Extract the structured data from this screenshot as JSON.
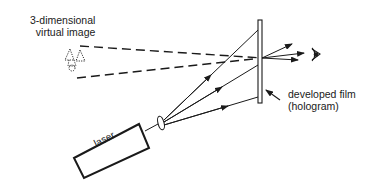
{
  "diagram": {
    "labels": {
      "virtual_image_line1": "3-dimensional",
      "virtual_image_line2": "virtual image",
      "film_line1": "developed film",
      "film_line2": "(hologram)",
      "laser": "laser"
    },
    "components": [
      {
        "id": "laser",
        "label": "laser"
      },
      {
        "id": "lens",
        "label": ""
      },
      {
        "id": "film",
        "label": "developed film (hologram)"
      },
      {
        "id": "eye",
        "label": ""
      },
      {
        "id": "virtual-image",
        "label": "3-dimensional virtual image"
      }
    ],
    "colors": {
      "ink": "#1a1a1a",
      "background": "#ffffff"
    }
  }
}
